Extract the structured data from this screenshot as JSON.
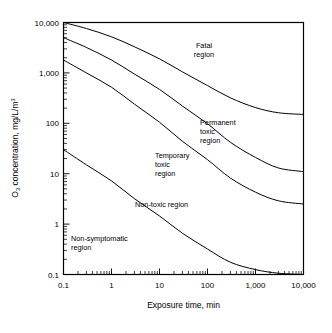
{
  "chart_data": {
    "type": "line",
    "title": "",
    "xlabel": "Exposure time, min",
    "ylabel": "O3 concentration, mg/L/m3",
    "ylabel_parts": {
      "lead": "O",
      "subscript": "3",
      "mid": " concentration, mg/L/m",
      "superscript": "3"
    },
    "xscale": "log",
    "yscale": "log",
    "xlim": [
      0.1,
      10000
    ],
    "ylim": [
      0.1,
      10000
    ],
    "grid": false,
    "legend": null,
    "xticklabels": [
      "0.1",
      "1",
      "10",
      "100",
      "1,000",
      "10,000"
    ],
    "xtickvalues": [
      0.1,
      1,
      10,
      100,
      1000,
      10000
    ],
    "yticklabels": [
      "0.1",
      "1",
      "10",
      "100",
      "1,000",
      "10,000"
    ],
    "ytickvalues": [
      0.1,
      1,
      10,
      100,
      1000,
      10000
    ],
    "series": [
      {
        "name": "Fatal / Permanent toxic boundary",
        "points": [
          [
            0.1,
            10000
          ],
          [
            0.3,
            7600
          ],
          [
            1,
            5200
          ],
          [
            3,
            3300
          ],
          [
            10,
            1900
          ],
          [
            30,
            1050
          ],
          [
            100,
            560
          ],
          [
            300,
            320
          ],
          [
            1000,
            205
          ],
          [
            3000,
            162
          ],
          [
            10000,
            150
          ]
        ]
      },
      {
        "name": "Permanent toxic / Temporary toxic boundary",
        "points": [
          [
            0.1,
            5000
          ],
          [
            0.3,
            3200
          ],
          [
            1,
            1800
          ],
          [
            3,
            950
          ],
          [
            10,
            470
          ],
          [
            30,
            220
          ],
          [
            100,
            98
          ],
          [
            300,
            42
          ],
          [
            1000,
            21
          ],
          [
            3000,
            13
          ],
          [
            10000,
            11
          ]
        ]
      },
      {
        "name": "Temporary toxic / Non-toxic boundary",
        "points": [
          [
            0.1,
            1800
          ],
          [
            0.3,
            1000
          ],
          [
            1,
            520
          ],
          [
            3,
            240
          ],
          [
            10,
            105
          ],
          [
            30,
            44
          ],
          [
            100,
            19
          ],
          [
            300,
            8.2
          ],
          [
            1000,
            4.3
          ],
          [
            3000,
            2.9
          ],
          [
            10000,
            2.5
          ]
        ]
      },
      {
        "name": "Non-toxic / Non-symptomatic boundary",
        "points": [
          [
            0.1,
            30
          ],
          [
            0.3,
            15
          ],
          [
            1,
            7.2
          ],
          [
            3,
            3.2
          ],
          [
            10,
            1.45
          ],
          [
            30,
            0.66
          ],
          [
            100,
            0.32
          ],
          [
            300,
            0.175
          ],
          [
            1000,
            0.125
          ],
          [
            3000,
            0.106
          ],
          [
            10000,
            0.1
          ]
        ]
      }
    ],
    "annotations": [
      {
        "text_lines": [
          "Fatal",
          "region"
        ],
        "x": 55,
        "y": 1400
      },
      {
        "text_lines": [
          "Permanent",
          "toxic",
          "region"
        ],
        "x": 230,
        "y": 62
      },
      {
        "text_lines": [
          "Temporary",
          "toxic",
          "region"
        ],
        "x": 62,
        "y": 11
      },
      {
        "text_lines": [
          "Non-toxic region"
        ],
        "x": 18,
        "y": 1.05
      },
      {
        "text_lines": [
          "Non-symptomatic",
          "region"
        ],
        "x": 0.33,
        "y": 0.62
      }
    ]
  },
  "axes": {
    "x_title": "Exposure time, min",
    "y_title_lead": "O",
    "y_title_sub": "3",
    "y_title_mid": " concentration, mg/L/m",
    "y_title_sup": "3"
  },
  "xlabels": {
    "t0": "0.1",
    "t1": "1",
    "t2": "10",
    "t3": "100",
    "t4": "1,000",
    "t5": "10,000"
  },
  "ylabels": {
    "t0": "0.1",
    "t1": "1",
    "t2": "10",
    "t3": "100",
    "t4": "1,000",
    "t5": "10,000"
  },
  "regions": {
    "fatal_1": "Fatal",
    "fatal_2": "region",
    "permanent_1": "Permanent",
    "permanent_2": "toxic",
    "permanent_3": "region",
    "temporary_1": "Temporary",
    "temporary_2": "toxic",
    "temporary_3": "region",
    "nontoxic_1": "Non-toxic region",
    "nonsymptomatic_1": "Non-symptomatic",
    "nonsymptomatic_2": "region"
  },
  "colors": {
    "line": "#000000",
    "background": "#ffffff",
    "text": "#000000"
  }
}
